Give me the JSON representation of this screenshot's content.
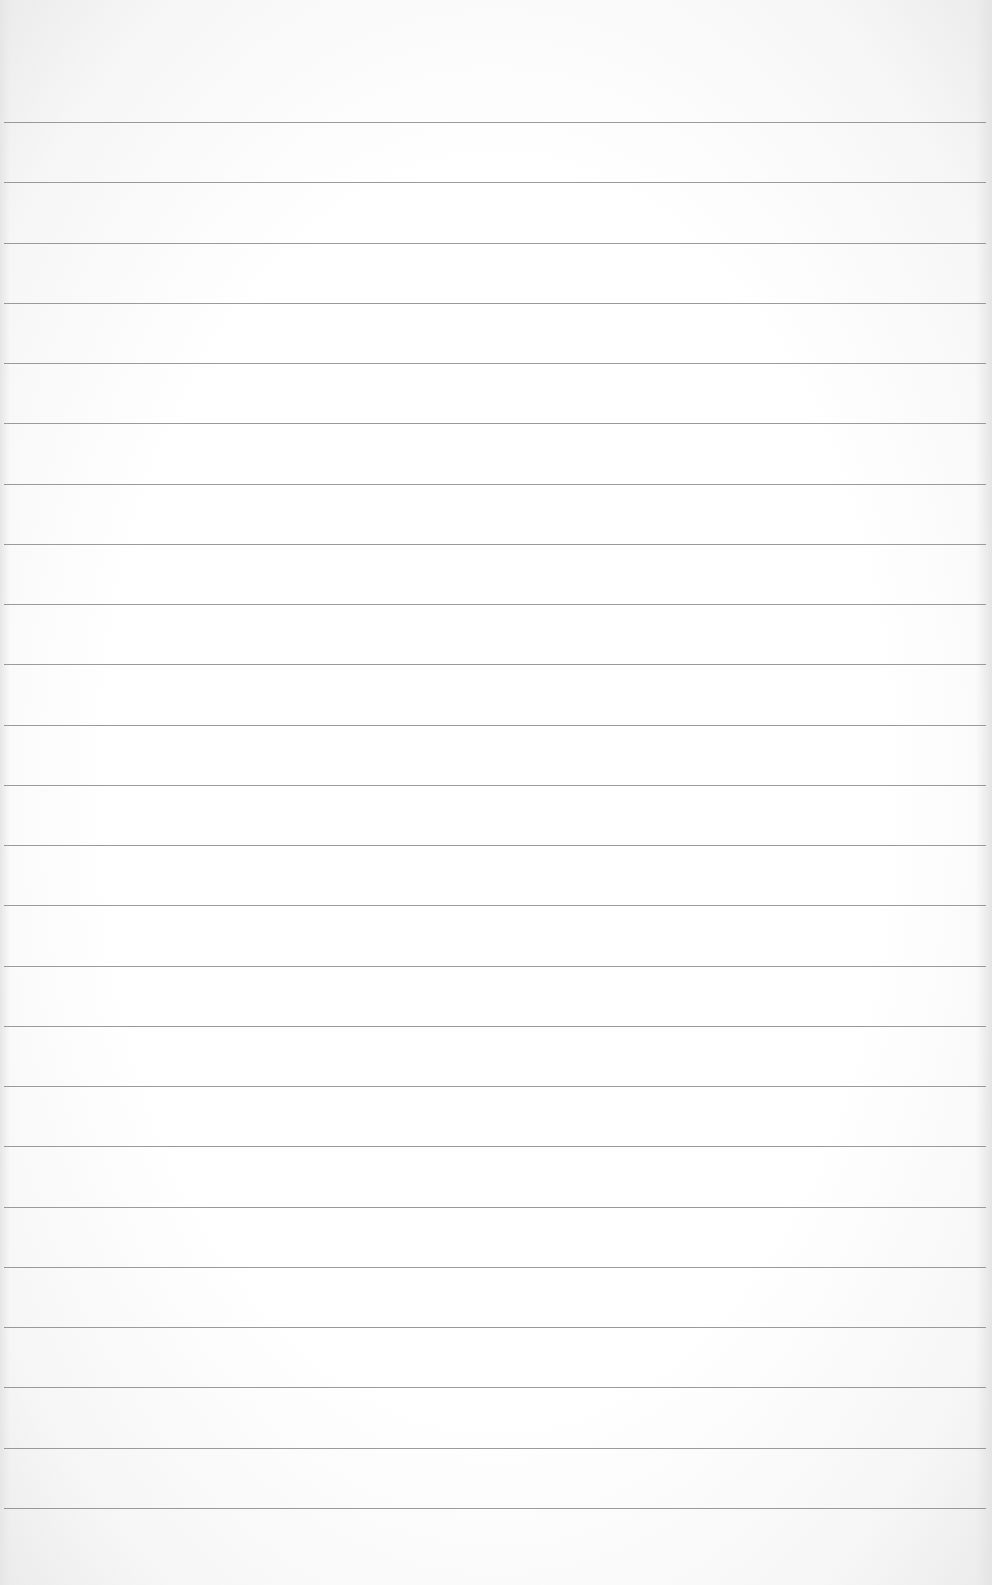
{
  "page": {
    "type": "lined-paper",
    "text": "",
    "rule_color": "#8a8a8a",
    "background_color": "#ffffff",
    "rule_count": 24,
    "first_rule_y": 122,
    "rule_spacing": 60.26
  }
}
